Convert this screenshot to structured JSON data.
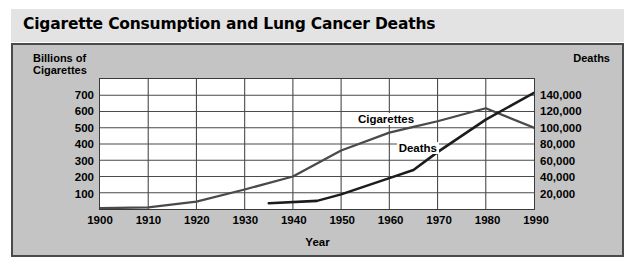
{
  "title": "Cigarette Consumption and Lung Cancer Deaths",
  "axes": {
    "y_left_caption_line1": "Billions of",
    "y_left_caption_line2": "Cigarettes",
    "y_right_caption": "Deaths",
    "x_caption": "Year"
  },
  "series_labels": {
    "cigarettes": "Cigarettes",
    "deaths": "Deaths"
  },
  "colors": {
    "page_background": "#ffffff",
    "title_bar": "#e3e3e3",
    "panel_background": "#c4c4c4",
    "panel_border": "#4a4a4a",
    "plot_background": "#ffffff",
    "gridline": "#4a4a4a",
    "line_cigarettes": "#4a4a4a",
    "line_deaths": "#1c1c1c",
    "text": "#000000"
  },
  "chart_data": {
    "type": "line",
    "title": "Cigarette Consumption and Lung Cancer Deaths",
    "xlabel": "Year",
    "ylabel": "Billions of Cigarettes",
    "y2label": "Deaths",
    "grid": true,
    "legend_position": "inline-annotations",
    "xlim": [
      1900,
      1990
    ],
    "xticks": [
      1900,
      1910,
      1920,
      1930,
      1940,
      1950,
      1960,
      1970,
      1980,
      1990
    ],
    "xticklabels": [
      "1900",
      "1910",
      "1920",
      "1930",
      "1940",
      "1950",
      "1960",
      "1970",
      "1980",
      "1990"
    ],
    "ylim": [
      0,
      800
    ],
    "yticks": [
      100,
      200,
      300,
      400,
      500,
      600,
      700
    ],
    "yticklabels": [
      "100",
      "200",
      "300",
      "400",
      "500",
      "600",
      "700"
    ],
    "y2lim": [
      0,
      160000
    ],
    "y2ticks": [
      20000,
      40000,
      60000,
      80000,
      100000,
      120000,
      140000
    ],
    "y2ticklabels": [
      "20,000",
      "40,000",
      "60,000",
      "80,000",
      "100,000",
      "120,000",
      "140,000"
    ],
    "series": [
      {
        "name": "Cigarettes",
        "axis": "left",
        "units": "billions of cigarettes",
        "x": [
          1900,
          1910,
          1920,
          1930,
          1940,
          1950,
          1960,
          1965,
          1970,
          1980,
          1990
        ],
        "values": [
          5,
          10,
          45,
          120,
          200,
          360,
          470,
          505,
          540,
          620,
          500
        ]
      },
      {
        "name": "Deaths",
        "axis": "right",
        "units": "lung cancer deaths",
        "x": [
          1935,
          1945,
          1950,
          1960,
          1965,
          1970,
          1980,
          1990
        ],
        "values": [
          7000,
          10000,
          18000,
          38000,
          48000,
          70000,
          110000,
          143000
        ]
      }
    ]
  }
}
